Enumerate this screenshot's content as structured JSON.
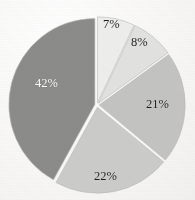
{
  "chart_data": {
    "type": "pie",
    "title": "",
    "subtitle": "",
    "xlabel": "",
    "ylabel": "",
    "legend_position": "none",
    "grid": false,
    "units": "percent",
    "total": 100,
    "start_angle_deg": 0,
    "direction": "clockwise",
    "exploded": true,
    "categories": [
      "7%",
      "8%",
      "21%",
      "22%",
      "42%"
    ],
    "values": [
      7,
      8,
      21,
      22,
      42
    ],
    "labels": [
      "7%",
      "8%",
      "21%",
      "22%",
      "42%"
    ],
    "slices": [
      {
        "label": "7%",
        "value": 7,
        "color": "#ededeb",
        "label_color": "#1d1d1d",
        "label_position": "inside",
        "start_deg": 0,
        "end_deg": 25.2
      },
      {
        "label": "8%",
        "value": 8,
        "color": "#e1e1df",
        "label_color": "#1d1d1d",
        "label_position": "inside",
        "start_deg": 25.2,
        "end_deg": 54.0
      },
      {
        "label": "21%",
        "value": 21,
        "color": "#c3c3c1",
        "label_color": "#1d1d1d",
        "label_position": "inside",
        "start_deg": 54.0,
        "end_deg": 129.6
      },
      {
        "label": "22%",
        "value": 22,
        "color": "#cbcbc9",
        "label_color": "#1d1d1d",
        "label_position": "inside",
        "start_deg": 129.6,
        "end_deg": 208.8
      },
      {
        "label": "42%",
        "value": 42,
        "color": "#8b8b89",
        "label_color": "#fdfdfd",
        "label_position": "inside",
        "start_deg": 208.8,
        "end_deg": 360.0
      }
    ],
    "geometry": {
      "center_x": 97,
      "center_y": 105,
      "radius": 86,
      "gap_stroke": "#fbfbfa",
      "gap_width": 3
    },
    "label_positions": [
      {
        "label": "7%",
        "x": 103,
        "y": 18,
        "tone": "dark"
      },
      {
        "label": "8%",
        "x": 131,
        "y": 36,
        "tone": "dark"
      },
      {
        "label": "21%",
        "x": 146,
        "y": 98,
        "tone": "dark"
      },
      {
        "label": "22%",
        "x": 94,
        "y": 170,
        "tone": "dark"
      },
      {
        "label": "42%",
        "x": 35,
        "y": 77,
        "tone": "light"
      }
    ]
  },
  "background": {
    "paper_color": "#fbfbfa",
    "outline_color": "#b9b9b7"
  }
}
